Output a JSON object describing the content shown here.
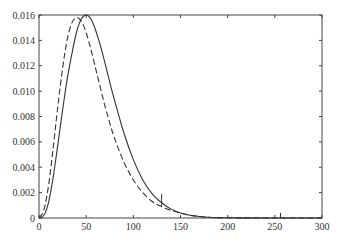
{
  "chart_data": {
    "type": "line",
    "title": "",
    "xlabel": "",
    "ylabel": "",
    "xlim": [
      0,
      300
    ],
    "ylim": [
      0,
      0.016
    ],
    "grid": false,
    "legend": null,
    "x_ticks": [
      "0",
      "50",
      "100",
      "150",
      "200",
      "250",
      "300"
    ],
    "y_ticks": [
      "0",
      "0.002",
      "0.004",
      "0.006",
      "0.008",
      "0.010",
      "0.012",
      "0.014",
      "0.016"
    ],
    "series": [
      {
        "name": "solid",
        "style": "solid",
        "color": "#333333",
        "x": [
          0,
          5,
          10,
          15,
          20,
          25,
          30,
          35,
          40,
          45,
          50,
          55,
          60,
          65,
          70,
          75,
          80,
          90,
          100,
          110,
          120,
          130,
          140,
          150,
          160,
          170,
          180,
          190,
          200,
          220,
          240,
          260,
          280,
          300
        ],
        "y": [
          0,
          0.0002,
          0.0012,
          0.0032,
          0.0058,
          0.0085,
          0.011,
          0.013,
          0.0147,
          0.0157,
          0.016,
          0.0157,
          0.0148,
          0.0136,
          0.0122,
          0.0107,
          0.0093,
          0.0067,
          0.0046,
          0.003,
          0.0019,
          0.0012,
          0.0007,
          0.0004,
          0.00022,
          0.00012,
          6e-05,
          3e-05,
          2e-05,
          1e-05,
          0,
          0,
          0,
          0
        ]
      },
      {
        "name": "dashed",
        "style": "dashed",
        "color": "#333333",
        "x": [
          0,
          5,
          10,
          15,
          20,
          25,
          30,
          35,
          40,
          45,
          50,
          55,
          60,
          65,
          70,
          75,
          80,
          90,
          100,
          110,
          120,
          130,
          140,
          150,
          160,
          170,
          180,
          190,
          200,
          220,
          240,
          260,
          280,
          300
        ],
        "y": [
          0,
          0.0006,
          0.0025,
          0.0055,
          0.0088,
          0.0118,
          0.0141,
          0.0154,
          0.0158,
          0.0155,
          0.0146,
          0.0133,
          0.0118,
          0.0103,
          0.0088,
          0.0075,
          0.0063,
          0.0044,
          0.003,
          0.002,
          0.0013,
          0.0009,
          0.0006,
          0.0004,
          0.00022,
          0.00012,
          6e-05,
          3e-05,
          2e-05,
          1e-05,
          0,
          0,
          0,
          0
        ]
      }
    ],
    "annotations": [
      {
        "type": "spike",
        "x": 130,
        "y_from": 0.0009,
        "y_to": 0.0019
      },
      {
        "type": "spike",
        "x": 256,
        "y_from": 0,
        "y_to": 0.0004
      }
    ]
  },
  "ui": {
    "plot_area": {
      "left": 39,
      "right": 322,
      "top": 15,
      "bottom": 218
    }
  }
}
